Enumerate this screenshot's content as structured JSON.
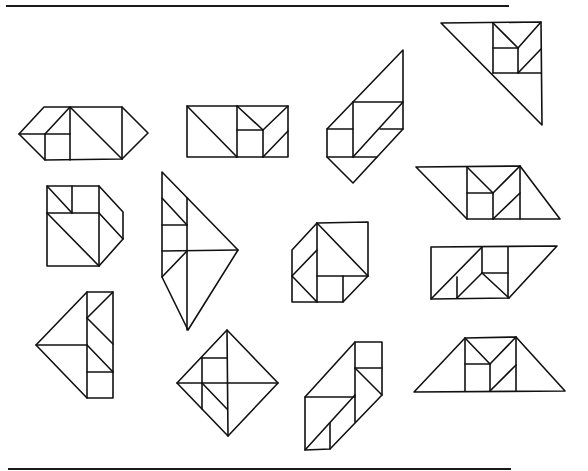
{
  "page": {
    "width": 588,
    "height": 471,
    "background": "#ffffff",
    "line_color": "#111111"
  },
  "rules": [
    {
      "name": "top-rule",
      "x1": 6,
      "y1": 6,
      "x2": 509,
      "y2": 6
    },
    {
      "name": "bottom-rule",
      "x1": 8,
      "y1": 469,
      "x2": 511,
      "y2": 469
    }
  ],
  "figures": [
    {
      "name": "figure-hexagon-left",
      "outline": [
        [
          19,
          134
        ],
        [
          44,
          107
        ],
        [
          122,
          107
        ],
        [
          148,
          133
        ],
        [
          122,
          159
        ],
        [
          45,
          160
        ]
      ],
      "lines": [
        [
          [
            70,
            107
          ],
          [
            70,
            160
          ]
        ],
        [
          [
            122,
            107
          ],
          [
            122,
            159
          ]
        ],
        [
          [
            19,
            134
          ],
          [
            70,
            134
          ]
        ],
        [
          [
            45,
            134
          ],
          [
            45,
            160
          ]
        ],
        [
          [
            45,
            134
          ],
          [
            70,
            107
          ]
        ],
        [
          [
            70,
            107
          ],
          [
            122,
            159
          ]
        ]
      ]
    },
    {
      "name": "figure-rectangle",
      "outline": [
        [
          187,
          106
        ],
        [
          288,
          106
        ],
        [
          288,
          157
        ],
        [
          187,
          157
        ]
      ],
      "lines": [
        [
          [
            187,
            106
          ],
          [
            237,
            157
          ]
        ],
        [
          [
            237,
            106
          ],
          [
            237,
            157
          ]
        ],
        [
          [
            263,
            130
          ],
          [
            263,
            157
          ]
        ],
        [
          [
            237,
            130
          ],
          [
            263,
            130
          ]
        ],
        [
          [
            237,
            106
          ],
          [
            263,
            130
          ]
        ],
        [
          [
            263,
            130
          ],
          [
            288,
            106
          ]
        ],
        [
          [
            263,
            157
          ],
          [
            288,
            131
          ]
        ]
      ]
    },
    {
      "name": "figure-tall-parallelogram",
      "outline": [
        [
          403,
          50
        ],
        [
          403,
          129
        ],
        [
          353,
          183
        ],
        [
          327,
          157
        ],
        [
          327,
          129
        ]
      ],
      "lines": [
        [
          [
            353,
            102
          ],
          [
            403,
            102
          ]
        ],
        [
          [
            353,
            102
          ],
          [
            353,
            157
          ]
        ],
        [
          [
            327,
            129
          ],
          [
            353,
            129
          ]
        ],
        [
          [
            327,
            157
          ],
          [
            377,
            157
          ]
        ],
        [
          [
            353,
            157
          ],
          [
            403,
            102
          ]
        ],
        [
          [
            380,
            129
          ],
          [
            403,
            129
          ]
        ]
      ]
    },
    {
      "name": "figure-large-triangle-top-right",
      "outline": [
        [
          441,
          23
        ],
        [
          541,
          22
        ],
        [
          542,
          125
        ]
      ],
      "lines": [
        [
          [
            493,
            23
          ],
          [
            493,
            73
          ]
        ],
        [
          [
            493,
            73
          ],
          [
            541,
            73
          ]
        ],
        [
          [
            493,
            23
          ],
          [
            518,
            48
          ]
        ],
        [
          [
            518,
            48
          ],
          [
            541,
            22
          ]
        ],
        [
          [
            493,
            48
          ],
          [
            518,
            48
          ]
        ],
        [
          [
            518,
            48
          ],
          [
            518,
            73
          ]
        ],
        [
          [
            518,
            73
          ],
          [
            541,
            49
          ]
        ]
      ]
    },
    {
      "name": "figure-square-with-wing",
      "outline": [
        [
          47,
          186
        ],
        [
          99,
          186
        ],
        [
          123,
          212
        ],
        [
          123,
          239
        ],
        [
          99,
          266
        ],
        [
          47,
          266
        ]
      ],
      "lines": [
        [
          [
            72,
            186
          ],
          [
            72,
            213
          ]
        ],
        [
          [
            47,
            213
          ],
          [
            99,
            213
          ]
        ],
        [
          [
            47,
            186
          ],
          [
            72,
            213
          ]
        ],
        [
          [
            99,
            186
          ],
          [
            99,
            266
          ]
        ],
        [
          [
            47,
            213
          ],
          [
            99,
            266
          ]
        ],
        [
          [
            99,
            213
          ],
          [
            123,
            239
          ]
        ]
      ]
    },
    {
      "name": "figure-kite",
      "outline": [
        [
          162,
          172
        ],
        [
          238,
          250
        ],
        [
          188,
          330
        ],
        [
          162,
          277
        ]
      ],
      "lines": [
        [
          [
            162,
            198
          ],
          [
            187,
            225
          ]
        ],
        [
          [
            187,
            198
          ],
          [
            187,
            330
          ]
        ],
        [
          [
            162,
            225
          ],
          [
            187,
            225
          ]
        ],
        [
          [
            162,
            251
          ],
          [
            238,
            250
          ]
        ],
        [
          [
            162,
            277
          ],
          [
            187,
            251
          ]
        ]
      ]
    },
    {
      "name": "figure-square-notched",
      "outline": [
        [
          317,
          223
        ],
        [
          368,
          222
        ],
        [
          368,
          276
        ],
        [
          343,
          302
        ],
        [
          292,
          302
        ],
        [
          292,
          250
        ]
      ],
      "lines": [
        [
          [
            317,
            223
          ],
          [
            317,
            302
          ]
        ],
        [
          [
            317,
            223
          ],
          [
            368,
            276
          ]
        ],
        [
          [
            317,
            276
          ],
          [
            368,
            276
          ]
        ],
        [
          [
            343,
            276
          ],
          [
            343,
            302
          ]
        ],
        [
          [
            292,
            276
          ],
          [
            317,
            250
          ]
        ],
        [
          [
            292,
            276
          ],
          [
            317,
            302
          ]
        ]
      ]
    },
    {
      "name": "figure-parallelogram-right",
      "outline": [
        [
          416,
          167
        ],
        [
          520,
          166
        ],
        [
          560,
          219
        ],
        [
          467,
          219
        ]
      ],
      "lines": [
        [
          [
            467,
            167
          ],
          [
            467,
            219
          ]
        ],
        [
          [
            520,
            166
          ],
          [
            520,
            219
          ]
        ],
        [
          [
            467,
            167
          ],
          [
            493,
            193
          ]
        ],
        [
          [
            493,
            193
          ],
          [
            520,
            166
          ]
        ],
        [
          [
            467,
            193
          ],
          [
            493,
            193
          ]
        ],
        [
          [
            493,
            193
          ],
          [
            493,
            219
          ]
        ],
        [
          [
            493,
            219
          ],
          [
            520,
            193
          ]
        ]
      ]
    },
    {
      "name": "figure-parallelogram-lower-right",
      "outline": [
        [
          431,
          247
        ],
        [
          557,
          246
        ],
        [
          509,
          298
        ],
        [
          431,
          299
        ]
      ],
      "lines": [
        [
          [
            431,
            299
          ],
          [
            482,
            247
          ]
        ],
        [
          [
            457,
            277
          ],
          [
            457,
            298
          ]
        ],
        [
          [
            457,
            298
          ],
          [
            482,
            273
          ]
        ],
        [
          [
            482,
            273
          ],
          [
            509,
            298
          ]
        ],
        [
          [
            482,
            247
          ],
          [
            482,
            273
          ]
        ],
        [
          [
            482,
            273
          ],
          [
            508,
            273
          ]
        ],
        [
          [
            508,
            247
          ],
          [
            508,
            298
          ]
        ]
      ]
    },
    {
      "name": "figure-arrow-left",
      "outline": [
        [
          36,
          345
        ],
        [
          87,
          292
        ],
        [
          113,
          292
        ],
        [
          113,
          398
        ],
        [
          87,
          398
        ]
      ],
      "lines": [
        [
          [
            87,
            292
          ],
          [
            87,
            398
          ]
        ],
        [
          [
            87,
            318
          ],
          [
            113,
            292
          ]
        ],
        [
          [
            87,
            318
          ],
          [
            113,
            344
          ]
        ],
        [
          [
            36,
            345
          ],
          [
            87,
            345
          ]
        ],
        [
          [
            87,
            345
          ],
          [
            113,
            372
          ]
        ],
        [
          [
            87,
            372
          ],
          [
            113,
            372
          ]
        ]
      ]
    },
    {
      "name": "figure-diamond",
      "outline": [
        [
          227,
          330
        ],
        [
          278,
          383
        ],
        [
          228,
          436
        ],
        [
          177,
          383
        ]
      ],
      "lines": [
        [
          [
            227,
            330
          ],
          [
            228,
            436
          ]
        ],
        [
          [
            177,
            383
          ],
          [
            278,
            383
          ]
        ],
        [
          [
            202,
            358
          ],
          [
            202,
            409
          ]
        ],
        [
          [
            202,
            358
          ],
          [
            227,
            358
          ]
        ],
        [
          [
            202,
            383
          ],
          [
            227,
            409
          ]
        ]
      ]
    },
    {
      "name": "figure-slanted-bottom",
      "outline": [
        [
          355,
          342
        ],
        [
          382,
          342
        ],
        [
          382,
          395
        ],
        [
          330,
          449
        ],
        [
          305,
          450
        ],
        [
          305,
          397
        ]
      ],
      "lines": [
        [
          [
            355,
            342
          ],
          [
            355,
            422
          ]
        ],
        [
          [
            355,
            368
          ],
          [
            382,
            368
          ]
        ],
        [
          [
            355,
            368
          ],
          [
            382,
            395
          ]
        ],
        [
          [
            305,
            397
          ],
          [
            355,
            397
          ]
        ],
        [
          [
            305,
            450
          ],
          [
            355,
            395
          ]
        ],
        [
          [
            330,
            423
          ],
          [
            330,
            449
          ]
        ]
      ]
    },
    {
      "name": "figure-trapezoid",
      "outline": [
        [
          414,
          392
        ],
        [
          465,
          338
        ],
        [
          516,
          337
        ],
        [
          565,
          391
        ]
      ],
      "lines": [
        [
          [
            465,
            338
          ],
          [
            465,
            391
          ]
        ],
        [
          [
            516,
            337
          ],
          [
            516,
            391
          ]
        ],
        [
          [
            465,
            338
          ],
          [
            490,
            364
          ]
        ],
        [
          [
            490,
            364
          ],
          [
            516,
            337
          ]
        ],
        [
          [
            465,
            364
          ],
          [
            490,
            364
          ]
        ],
        [
          [
            490,
            364
          ],
          [
            490,
            391
          ]
        ],
        [
          [
            490,
            391
          ],
          [
            516,
            365
          ]
        ]
      ]
    }
  ]
}
